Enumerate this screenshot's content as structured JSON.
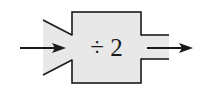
{
  "diagram": {
    "machine_label": "÷ 2",
    "input_arrow": "input-arrow",
    "output_arrow": "output-arrow",
    "colors": {
      "fill": "#e8e8e8",
      "stroke": "#1a1a1a",
      "background": "#ffffff"
    }
  }
}
